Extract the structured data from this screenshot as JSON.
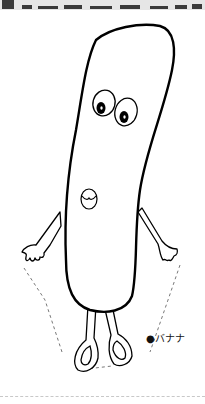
{
  "header": {
    "partial_title": ""
  },
  "illustration": {
    "subject": "banana character",
    "stroke_color": "#000000",
    "background": "#ffffff",
    "guide_line_color": "#555555"
  },
  "caption": {
    "label": "●バナナ"
  }
}
